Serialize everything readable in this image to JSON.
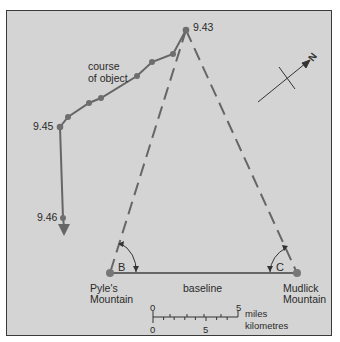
{
  "diagram": {
    "course_label_line1": "course",
    "course_label_line2": "of object",
    "time_labels": {
      "t943": "9.43",
      "t945": "9.45",
      "t946": "9.46"
    },
    "stations": {
      "left_line1": "Pyle's",
      "left_line2": "Mountain",
      "right_line1": "Mudlick",
      "right_line2": "Mountain"
    },
    "baseline_label": "baseline",
    "angles": {
      "left": "B",
      "right": "C"
    },
    "compass": {
      "label": "N"
    },
    "scale": {
      "miles_zero": "0",
      "miles_max": "5",
      "miles_label": "miles",
      "km_zero": "0",
      "km_mid": "5",
      "km_label": "kilometres"
    },
    "colors": {
      "background": "#d4d4d4",
      "line": "#666666",
      "point": "#6e6e6e",
      "text": "#2a2a2a"
    },
    "course_points": [
      {
        "x": 186,
        "y": 30,
        "label": "9.43"
      },
      {
        "x": 173,
        "y": 54
      },
      {
        "x": 152,
        "y": 62
      },
      {
        "x": 137,
        "y": 76
      },
      {
        "x": 101,
        "y": 98
      },
      {
        "x": 89,
        "y": 103
      },
      {
        "x": 68,
        "y": 117
      },
      {
        "x": 60,
        "y": 127,
        "label": "9.45"
      },
      {
        "x": 63,
        "y": 218,
        "label": "9.46"
      }
    ]
  }
}
